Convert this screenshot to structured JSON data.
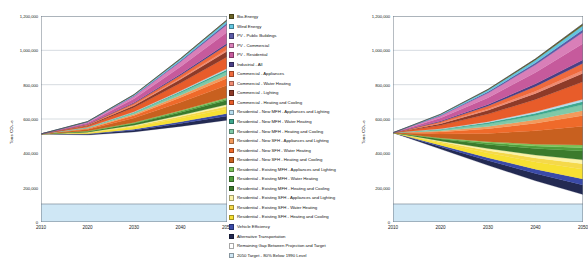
{
  "chart_data": [
    {
      "id": "left",
      "type": "area",
      "title": "",
      "xlabel": "",
      "ylabel": "Tons CO2-e",
      "x": [
        2010,
        2020,
        2030,
        2040,
        2050
      ],
      "xlim": [
        2010,
        2050
      ],
      "ylim": [
        0,
        1200000
      ],
      "yticks": [
        0,
        200000,
        400000,
        600000,
        800000,
        1000000,
        1200000
      ],
      "ytick_labels": [
        "0",
        "200,000",
        "400,000",
        "600,000",
        "800,000",
        "1,000,000",
        "1,200,000"
      ],
      "xticks": [
        2010,
        2020,
        2030,
        2040,
        2050
      ],
      "xtick_labels": [
        "2010",
        "2020",
        "2030",
        "2040",
        "2050"
      ],
      "grid": true,
      "legend_position": "right",
      "baseline": [
        105000,
        105000,
        105000,
        105000,
        105000
      ],
      "projection_top": [
        520000,
        515000,
        540000,
        580000,
        620000
      ],
      "series": [
        {
          "name": "2050 Target - 80% Below 1990 Level",
          "values": [
            105000,
            105000,
            105000,
            105000,
            105000
          ]
        },
        {
          "name": "Remaining Gap Between Projection and Target",
          "values": [
            408000,
            402000,
            420000,
            452000,
            488000
          ]
        },
        {
          "name": "Alternative Transportation",
          "values": [
            0,
            4000,
            10000,
            17000,
            25000
          ]
        },
        {
          "name": "Vehicle Efficiency",
          "values": [
            0,
            2500,
            6000,
            10000,
            14000
          ]
        },
        {
          "name": "Residential - Existing SFH - Heating and Cooling",
          "values": [
            0,
            5000,
            12000,
            20000,
            28000
          ]
        },
        {
          "name": "Residential - Existing SFH - Water Heating",
          "values": [
            0,
            2500,
            6000,
            10000,
            14000
          ]
        },
        {
          "name": "Residential - Existing SFH - Appliances and Lighting",
          "values": [
            0,
            1800,
            4500,
            7500,
            10500
          ]
        },
        {
          "name": "Residential - Existing MFH - Heating and Cooling",
          "values": [
            0,
            4000,
            10000,
            17000,
            24000
          ]
        },
        {
          "name": "Residential - Existing MFH - Water Heating",
          "values": [
            0,
            1500,
            3500,
            6000,
            8500
          ]
        },
        {
          "name": "Residential - Existing MFH - Appliances and Lighting",
          "values": [
            0,
            1200,
            3000,
            5000,
            7000
          ]
        },
        {
          "name": "Residential - New SFH - Heating and Cooling",
          "values": [
            0,
            9000,
            26000,
            48000,
            72000
          ]
        },
        {
          "name": "Residential - New SFH - Water Heating",
          "values": [
            0,
            5000,
            15000,
            28000,
            42000
          ]
        },
        {
          "name": "Residential - New SFH - Appliances and Lighting",
          "values": [
            0,
            2500,
            7000,
            13000,
            19000
          ]
        },
        {
          "name": "Residential - New MFH - Heating and Cooling",
          "values": [
            0,
            3000,
            8000,
            14000,
            20000
          ]
        },
        {
          "name": "Residential - New MFH - Water Heating",
          "values": [
            0,
            1500,
            4000,
            7000,
            10000
          ]
        },
        {
          "name": "Residential - New MFH - Appliances and Lighting",
          "values": [
            0,
            1000,
            2500,
            4500,
            6500
          ]
        },
        {
          "name": "Commercial - Heating and Cooling",
          "values": [
            0,
            8000,
            24000,
            45000,
            68000
          ]
        },
        {
          "name": "Commercial - Lighting",
          "values": [
            0,
            4000,
            12000,
            22000,
            33000
          ]
        },
        {
          "name": "Commercial - Water Heating",
          "values": [
            0,
            1500,
            4000,
            7000,
            10000
          ]
        },
        {
          "name": "Commercial - Appliances",
          "values": [
            0,
            3000,
            9000,
            17000,
            26000
          ]
        },
        {
          "name": "Industrial - All",
          "values": [
            0,
            1500,
            4000,
            7500,
            11000
          ]
        },
        {
          "name": "PV - Residential",
          "values": [
            0,
            7000,
            22000,
            42000,
            64000
          ]
        },
        {
          "name": "PV - Commercial",
          "values": [
            0,
            5000,
            15000,
            29000,
            44000
          ]
        },
        {
          "name": "PV - Public Buildings",
          "values": [
            0,
            1200,
            3500,
            6500,
            9500
          ]
        },
        {
          "name": "Wind Energy",
          "values": [
            0,
            1500,
            4500,
            8500,
            13000
          ]
        },
        {
          "name": "Bio-Energy",
          "values": [
            0,
            800,
            2200,
            4000,
            6000
          ]
        }
      ]
    },
    {
      "id": "right",
      "type": "area",
      "title": "",
      "xlabel": "",
      "ylabel": "Tons CO2-e",
      "x": [
        2010,
        2020,
        2030,
        2040,
        2050
      ],
      "xlim": [
        2010,
        2050
      ],
      "ylim": [
        0,
        1200000
      ],
      "yticks": [
        0,
        200000,
        400000,
        600000,
        800000,
        1000000,
        1200000
      ],
      "ytick_labels": [
        "0",
        "200,000",
        "400,000",
        "600,000",
        "800,000",
        "1,000,000",
        "1,200,000"
      ],
      "xticks": [
        2010,
        2020,
        2030,
        2040,
        2050
      ],
      "xtick_labels": [
        "2010",
        "2020",
        "2030",
        "2040",
        "2050"
      ],
      "grid": true,
      "legend_position": "none",
      "baseline": [
        105000,
        105000,
        105000,
        105000,
        105000
      ],
      "projection_top": [
        520000,
        520000,
        520000,
        520000,
        520000
      ],
      "series": [
        {
          "name": "2050 Target - 80% Below 1990 Level",
          "values": [
            105000,
            105000,
            105000,
            105000,
            105000
          ]
        },
        {
          "name": "Remaining Gap Between Projection and Target",
          "values": [
            415000,
            320000,
            225000,
            135000,
            55000
          ]
        },
        {
          "name": "Alternative Transportation",
          "values": [
            0,
            14000,
            28000,
            42000,
            56000
          ]
        },
        {
          "name": "Vehicle Efficiency",
          "values": [
            0,
            8000,
            17000,
            26000,
            35000
          ]
        },
        {
          "name": "Residential - Existing SFH - Heating and Cooling",
          "values": [
            0,
            13000,
            27000,
            42000,
            57000
          ]
        },
        {
          "name": "Residential - Existing SFH - Water Heating",
          "values": [
            0,
            7000,
            15000,
            23000,
            31000
          ]
        },
        {
          "name": "Residential - Existing SFH - Appliances and Lighting",
          "values": [
            0,
            5000,
            11000,
            17000,
            23000
          ]
        },
        {
          "name": "Residential - Existing MFH - Heating and Cooling",
          "values": [
            0,
            11000,
            24000,
            38000,
            52000
          ]
        },
        {
          "name": "Residential - Existing MFH - Water Heating",
          "values": [
            0,
            4000,
            9000,
            14000,
            19000
          ]
        },
        {
          "name": "Residential - Existing MFH - Appliances and Lighting",
          "values": [
            0,
            3000,
            7000,
            11000,
            15000
          ]
        },
        {
          "name": "Residential - New SFH - Heating and Cooling",
          "values": [
            0,
            22000,
            48000,
            78000,
            110000
          ]
        },
        {
          "name": "Residential - New SFH - Water Heating",
          "values": [
            0,
            12000,
            27000,
            44000,
            62000
          ]
        },
        {
          "name": "Residential - New SFH - Appliances and Lighting",
          "values": [
            0,
            6000,
            13000,
            21000,
            30000
          ]
        },
        {
          "name": "Residential - New MFH - Heating and Cooling",
          "values": [
            0,
            7000,
            15000,
            24000,
            34000
          ]
        },
        {
          "name": "Residential - New MFH - Water Heating",
          "values": [
            0,
            3500,
            8000,
            13000,
            18000
          ]
        },
        {
          "name": "Residential - New MFH - Appliances and Lighting",
          "values": [
            0,
            2500,
            5500,
            9000,
            12500
          ]
        },
        {
          "name": "Commercial - Heating and Cooling",
          "values": [
            0,
            20000,
            44000,
            72000,
            102000
          ]
        },
        {
          "name": "Commercial - Lighting",
          "values": [
            0,
            10000,
            22000,
            35000,
            50000
          ]
        },
        {
          "name": "Commercial - Water Heating",
          "values": [
            0,
            3500,
            8000,
            13000,
            18000
          ]
        },
        {
          "name": "Commercial - Appliances",
          "values": [
            0,
            8000,
            17000,
            28000,
            40000
          ]
        },
        {
          "name": "Industrial - All",
          "values": [
            0,
            4000,
            9000,
            15000,
            21000
          ]
        },
        {
          "name": "PV - Residential",
          "values": [
            0,
            18000,
            40000,
            66000,
            95000
          ]
        },
        {
          "name": "PV - Commercial",
          "values": [
            0,
            12000,
            27000,
            45000,
            65000
          ]
        },
        {
          "name": "PV - Public Buildings",
          "values": [
            0,
            3000,
            7000,
            11000,
            16000
          ]
        },
        {
          "name": "Wind Energy",
          "values": [
            0,
            4500,
            10000,
            16000,
            23000
          ]
        },
        {
          "name": "Bio-Energy",
          "values": [
            0,
            2000,
            4500,
            7500,
            11000
          ]
        }
      ]
    }
  ],
  "legend": {
    "items": [
      {
        "label": "Bio-Energy",
        "color": "#6b6326"
      },
      {
        "label": "Wind Energy",
        "color": "#63c6e0"
      },
      {
        "label": "PV - Public Buildings",
        "color": "#5b5ba6"
      },
      {
        "label": "PV - Commercial",
        "color": "#d97fb8"
      },
      {
        "label": "PV - Residential",
        "color": "#c65a9c"
      },
      {
        "label": "Industrial - All",
        "color": "#4a3f86"
      },
      {
        "label": "Commercial - Appliances",
        "color": "#ef6a3d"
      },
      {
        "label": "Commercial - Water Heating",
        "color": "#f08b72"
      },
      {
        "label": "Commercial - Lighting",
        "color": "#8e3a28"
      },
      {
        "label": "Commercial - Heating and Cooling",
        "color": "#e85c2a"
      },
      {
        "label": "Residential - New MFH - Appliances and Lighting",
        "color": "#b7def0"
      },
      {
        "label": "Residential - New MFH - Water Heating",
        "color": "#3ea88e"
      },
      {
        "label": "Residential - New MFH - Heating and Cooling",
        "color": "#7fc9a8"
      },
      {
        "label": "Residential - New SFH - Appliances and Lighting",
        "color": "#f39a5c"
      },
      {
        "label": "Residential - New SFH - Water Heating",
        "color": "#ef6a2a"
      },
      {
        "label": "Residential - New SFH - Heating and Cooling",
        "color": "#c8601f"
      },
      {
        "label": "Residential - Existing MFH - Appliances and Lighting",
        "color": "#7cc45a"
      },
      {
        "label": "Residential - Existing MFH - Water Heating",
        "color": "#4f9e3c"
      },
      {
        "label": "Residential - Existing MFH - Heating and Cooling",
        "color": "#3b7a2c"
      },
      {
        "label": "Residential - Existing SFH - Appliances and Lighting",
        "color": "#fbf3a8"
      },
      {
        "label": "Residential - Existing SFH - Water Heating",
        "color": "#f5d94a"
      },
      {
        "label": "Residential - Existing SFH - Heating and Cooling",
        "color": "#f7e032"
      },
      {
        "label": "Vehicle Efficiency",
        "color": "#3a4aa8"
      },
      {
        "label": "Alternative Transportation",
        "color": "#232a52"
      },
      {
        "label": "Remaining Gap Between Projection and Target",
        "color": "#ffffff"
      },
      {
        "label": "2050 Target - 80% Below 1990 Level",
        "color": "#cfe7f5"
      }
    ]
  },
  "colors": {
    "axis": "#6f7b86",
    "grid": "#9aa7b3",
    "target_band": "#cfe7f5",
    "gap_fill": "#ffffff",
    "text": "#111111"
  }
}
